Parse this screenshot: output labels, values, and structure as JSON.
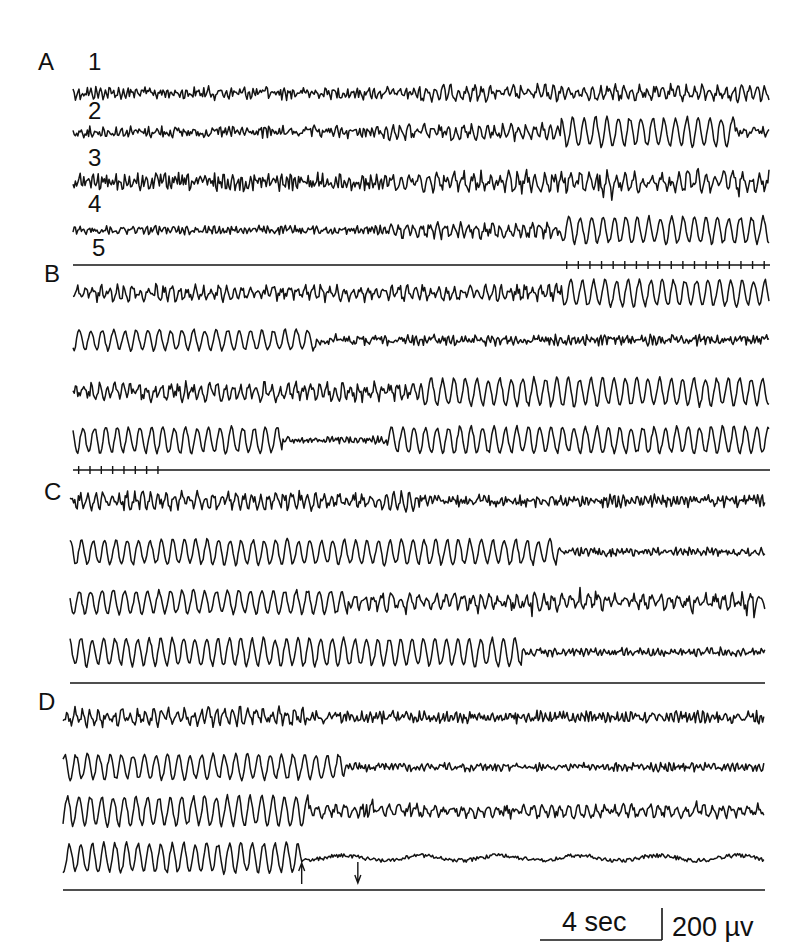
{
  "figure": {
    "panels": [
      {
        "label": "A",
        "channel_labels": [
          "1",
          "2",
          "3",
          "4",
          "5"
        ],
        "traces": [
          {
            "segments": [
              {
                "from": 0,
                "to": 0.5,
                "kind": "fast",
                "amp": 0.55
              },
              {
                "from": 0.5,
                "to": 1,
                "kind": "mixed",
                "amp": 0.6
              }
            ]
          },
          {
            "segments": [
              {
                "from": 0,
                "to": 0.45,
                "kind": "fast",
                "amp": 0.5
              },
              {
                "from": 0.45,
                "to": 0.7,
                "kind": "mixed",
                "amp": 0.6
              },
              {
                "from": 0.7,
                "to": 0.95,
                "kind": "rhythmic",
                "amp": 1.0
              },
              {
                "from": 0.95,
                "to": 1,
                "kind": "fast",
                "amp": 0.4
              }
            ]
          },
          {
            "segments": [
              {
                "from": 0,
                "to": 0.45,
                "kind": "fast",
                "amp": 0.7
              },
              {
                "from": 0.45,
                "to": 1,
                "kind": "spiky",
                "amp": 0.85
              }
            ]
          },
          {
            "segments": [
              {
                "from": 0,
                "to": 0.45,
                "kind": "fast",
                "amp": 0.35
              },
              {
                "from": 0.45,
                "to": 0.7,
                "kind": "mixed",
                "amp": 0.6
              },
              {
                "from": 0.7,
                "to": 1,
                "kind": "rhythmic",
                "amp": 0.9
              }
            ]
          }
        ],
        "time_marks": {
          "from": 0.7,
          "to": 1,
          "count": 18
        }
      },
      {
        "label": "B",
        "channel_labels": [],
        "traces": [
          {
            "segments": [
              {
                "from": 0,
                "to": 0.7,
                "kind": "mixed",
                "amp": 0.6
              },
              {
                "from": 0.7,
                "to": 1,
                "kind": "rhythmic",
                "amp": 0.9
              }
            ]
          },
          {
            "segments": [
              {
                "from": 0,
                "to": 0.35,
                "kind": "rhythmic",
                "amp": 0.7
              },
              {
                "from": 0.35,
                "to": 1,
                "kind": "fast",
                "amp": 0.45
              }
            ]
          },
          {
            "segments": [
              {
                "from": 0,
                "to": 0.5,
                "kind": "mixed",
                "amp": 0.7
              },
              {
                "from": 0.5,
                "to": 1,
                "kind": "rhythmic",
                "amp": 0.95
              }
            ]
          },
          {
            "segments": [
              {
                "from": 0,
                "to": 0.3,
                "kind": "rhythmic",
                "amp": 0.9
              },
              {
                "from": 0.3,
                "to": 0.45,
                "kind": "fast",
                "amp": 0.3
              },
              {
                "from": 0.45,
                "to": 1,
                "kind": "rhythmic",
                "amp": 0.9
              }
            ]
          }
        ],
        "time_marks": {
          "from": 0,
          "to": 0.13,
          "count": 8
        }
      },
      {
        "label": "C",
        "channel_labels": [],
        "traces": [
          {
            "segments": [
              {
                "from": 0,
                "to": 0.5,
                "kind": "mixed",
                "amp": 0.7
              },
              {
                "from": 0.5,
                "to": 1,
                "kind": "fast",
                "amp": 0.5
              }
            ]
          },
          {
            "segments": [
              {
                "from": 0,
                "to": 0.7,
                "kind": "rhythmic",
                "amp": 0.85
              },
              {
                "from": 0.7,
                "to": 1,
                "kind": "fast",
                "amp": 0.35
              }
            ]
          },
          {
            "segments": [
              {
                "from": 0,
                "to": 0.4,
                "kind": "rhythmic",
                "amp": 0.8
              },
              {
                "from": 0.4,
                "to": 1,
                "kind": "spiky",
                "amp": 0.7
              }
            ]
          },
          {
            "segments": [
              {
                "from": 0,
                "to": 0.65,
                "kind": "rhythmic",
                "amp": 0.95
              },
              {
                "from": 0.65,
                "to": 1,
                "kind": "fast",
                "amp": 0.35
              }
            ]
          }
        ],
        "time_marks": null
      },
      {
        "label": "D",
        "channel_labels": [],
        "traces": [
          {
            "segments": [
              {
                "from": 0,
                "to": 0.35,
                "kind": "mixed",
                "amp": 0.7
              },
              {
                "from": 0.35,
                "to": 1,
                "kind": "fast",
                "amp": 0.5
              }
            ]
          },
          {
            "segments": [
              {
                "from": 0,
                "to": 0.4,
                "kind": "rhythmic",
                "amp": 0.85
              },
              {
                "from": 0.4,
                "to": 1,
                "kind": "fast",
                "amp": 0.35
              }
            ]
          },
          {
            "segments": [
              {
                "from": 0,
                "to": 0.35,
                "kind": "rhythmic",
                "amp": 1.0
              },
              {
                "from": 0.35,
                "to": 1,
                "kind": "spiky",
                "amp": 0.55
              }
            ]
          },
          {
            "segments": [
              {
                "from": 0,
                "to": 0.34,
                "kind": "rhythmic",
                "amp": 1.0
              },
              {
                "from": 0.34,
                "to": 1,
                "kind": "slowflat",
                "amp": 0.35
              }
            ]
          }
        ],
        "time_marks": null,
        "arrows": [
          {
            "at": 0.34,
            "direction": "up"
          },
          {
            "at": 0.42,
            "direction": "down"
          }
        ]
      }
    ],
    "scale_bar": {
      "time_label": "4 sec",
      "voltage_label": "200 µv"
    }
  }
}
